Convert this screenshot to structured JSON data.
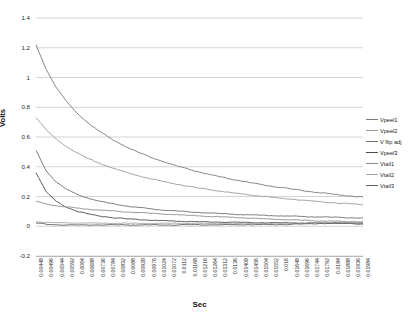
{
  "chart_data": {
    "type": "line",
    "title": "",
    "xlabel": "Sec",
    "ylabel": "Volts",
    "ylim": [
      -0.2,
      1.4
    ],
    "ytick_step": 0.2,
    "grid": true,
    "legend_position": "right",
    "yticks": [
      "1.4",
      "1.2",
      "1",
      "0.8",
      "0.6",
      "0.4",
      "0.2",
      "0",
      "-0.2"
    ],
    "ytick_values": [
      1.4,
      1.2,
      1.0,
      0.8,
      0.6,
      0.4,
      0.2,
      0.0,
      -0.2
    ],
    "xticks": [
      "0.00448",
      "0.00496",
      "0.00544",
      "0.00592",
      "0.0064",
      "0.00688",
      "0.00736",
      "0.00784",
      "0.00832",
      "0.0088",
      "0.00928",
      "0.00976",
      "0.01024",
      "0.01072",
      "0.0112",
      "0.01168",
      "0.01216",
      "0.01264",
      "0.01312",
      "0.0136",
      "0.01408",
      "0.01456",
      "0.01504",
      "0.01552",
      "0.016",
      "0.01648",
      "0.01696",
      "0.01744",
      "0.01792",
      "0.0184",
      "0.01888",
      "0.01936",
      "0.01984"
    ],
    "xtick_values": [
      0.00448,
      0.00496,
      0.00544,
      0.00592,
      0.0064,
      0.00688,
      0.00736,
      0.00784,
      0.00832,
      0.0088,
      0.00928,
      0.00976,
      0.01024,
      0.01072,
      0.0112,
      0.01168,
      0.01216,
      0.01264,
      0.01312,
      0.0136,
      0.01408,
      0.01456,
      0.01504,
      0.01552,
      0.016,
      0.01648,
      0.01696,
      0.01744,
      0.01792,
      0.0184,
      0.01888,
      0.01936,
      0.01984
    ],
    "xlim": [
      0.00448,
      0.01984
    ],
    "series": [
      {
        "name": "Vpeel1",
        "color": "#7a7a7a",
        "values": [
          1.22,
          1.055,
          0.93,
          0.838,
          0.762,
          0.7,
          0.648,
          0.603,
          0.564,
          0.529,
          0.498,
          0.47,
          0.445,
          0.422,
          0.401,
          0.382,
          0.364,
          0.347,
          0.332,
          0.318,
          0.305,
          0.292,
          0.281,
          0.27,
          0.26,
          0.25,
          0.241,
          0.232,
          0.224,
          0.216,
          0.209,
          0.202,
          0.196
        ]
      },
      {
        "name": "Vpeel2",
        "color": "#9a9a9a",
        "values": [
          0.73,
          0.648,
          0.585,
          0.535,
          0.494,
          0.459,
          0.429,
          0.403,
          0.38,
          0.359,
          0.34,
          0.323,
          0.308,
          0.293,
          0.28,
          0.268,
          0.256,
          0.246,
          0.236,
          0.227,
          0.218,
          0.21,
          0.202,
          0.195,
          0.188,
          0.182,
          0.176,
          0.17,
          0.164,
          0.159,
          0.154,
          0.15,
          0.145
        ]
      },
      {
        "name": "V flip adj",
        "color": "#6e6e6e",
        "values": [
          0.51,
          0.372,
          0.296,
          0.248,
          0.215,
          0.191,
          0.172,
          0.157,
          0.145,
          0.135,
          0.126,
          0.119,
          0.112,
          0.106,
          0.101,
          0.097,
          0.093,
          0.089,
          0.086,
          0.082,
          0.079,
          0.077,
          0.074,
          0.072,
          0.07,
          0.068,
          0.066,
          0.064,
          0.062,
          0.06,
          0.059,
          0.057,
          0.056
        ]
      },
      {
        "name": "Vpeel3",
        "color": "#4b4b4b",
        "values": [
          0.36,
          0.232,
          0.166,
          0.127,
          0.101,
          0.084,
          0.071,
          0.062,
          0.055,
          0.049,
          0.045,
          0.041,
          0.038,
          0.036,
          0.034,
          0.032,
          0.03,
          0.029,
          0.028,
          0.027,
          0.026,
          0.025,
          0.024,
          0.024,
          0.023,
          0.023,
          0.022,
          0.022,
          0.021,
          0.021,
          0.021,
          0.02,
          0.02
        ]
      },
      {
        "name": "Vtail1",
        "color": "#8c8c8c",
        "values": [
          0.168,
          0.15,
          0.138,
          0.129,
          0.122,
          0.116,
          0.11,
          0.105,
          0.1,
          0.096,
          0.092,
          0.088,
          0.084,
          0.08,
          0.077,
          0.073,
          0.07,
          0.066,
          0.063,
          0.06,
          0.057,
          0.054,
          0.051,
          0.048,
          0.045,
          0.043,
          0.04,
          0.038,
          0.036,
          0.034,
          0.032,
          0.031,
          0.03
        ]
      },
      {
        "name": "Vtail2",
        "color": "#a5a5a5",
        "values": [
          0.03,
          0.026,
          0.024,
          0.023,
          0.022,
          0.022,
          0.021,
          0.021,
          0.021,
          0.02,
          0.02,
          0.02,
          0.02,
          0.019,
          0.019,
          0.019,
          0.019,
          0.019,
          0.018,
          0.018,
          0.018,
          0.018,
          0.018,
          0.018,
          0.018,
          0.019,
          0.02,
          0.022,
          0.024,
          0.026,
          0.027,
          0.026,
          0.022
        ]
      },
      {
        "name": "Vtail3",
        "color": "#5c5c5c",
        "values": [
          0.022,
          0.013,
          0.01,
          0.009,
          0.009,
          0.009,
          0.009,
          0.009,
          0.009,
          0.009,
          0.009,
          0.009,
          0.009,
          0.009,
          0.009,
          0.01,
          0.01,
          0.01,
          0.01,
          0.01,
          0.01,
          0.011,
          0.011,
          0.011,
          0.012,
          0.013,
          0.015,
          0.017,
          0.019,
          0.02,
          0.019,
          0.017,
          0.014
        ]
      }
    ]
  },
  "legend": {
    "items": [
      {
        "label": "Vpeel1"
      },
      {
        "label": "Vpeel2"
      },
      {
        "label": "V flip adj"
      },
      {
        "label": "Vpeel3"
      },
      {
        "label": "Vtail1"
      },
      {
        "label": "Vtail2"
      },
      {
        "label": "Vtail3"
      }
    ]
  },
  "colors": {
    "grid": "#c9c9c9",
    "axis": "#b9b9b9",
    "text": "#1a1a1a",
    "background": "#ffffff"
  }
}
